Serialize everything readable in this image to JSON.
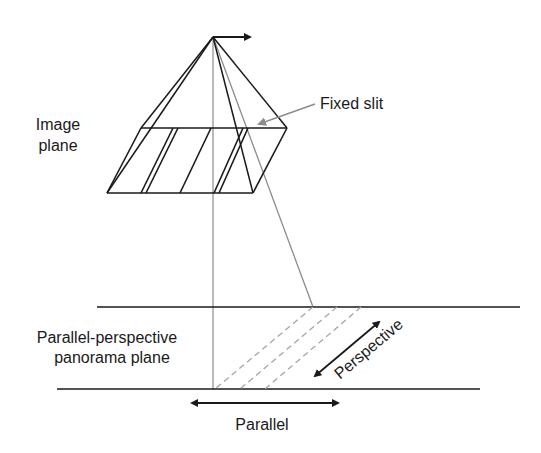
{
  "labels": {
    "image_plane_line1": "Image",
    "image_plane_line2": "plane",
    "fixed_slit": "Fixed slit",
    "panorama_line1": "Parallel-perspective",
    "panorama_line2": "panorama plane",
    "perspective": "Perspective",
    "parallel": "Parallel"
  },
  "colors": {
    "ink": "#1a1a1a",
    "gray_line": "#8c8c8c",
    "dashed": "#a6a6a6"
  }
}
